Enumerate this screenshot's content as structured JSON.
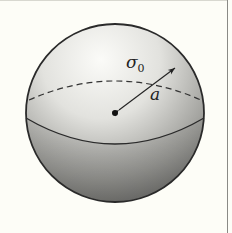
{
  "figure": {
    "type": "charged-sphere-diagram",
    "labels": {
      "surface_charge": "σ",
      "surface_charge_subscript": "0",
      "radius": "a"
    },
    "colors": {
      "background": "#fdfdf7",
      "outline": "#2a2a2a",
      "sphere_light": "#f4f4f0",
      "sphere_dark": "#6e6e6c",
      "frame": "#8a8a86"
    }
  }
}
